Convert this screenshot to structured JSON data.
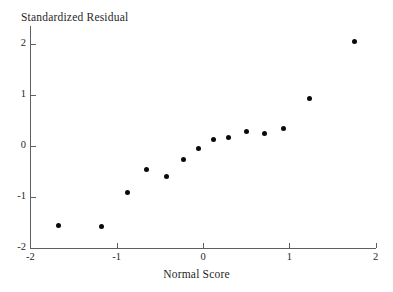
{
  "chart_data": {
    "type": "scatter",
    "title": "Standardized Residual",
    "xlabel": "Normal Score",
    "ylabel": "Standardized Residual",
    "xlim": [
      -2,
      2
    ],
    "ylim": [
      -2,
      2
    ],
    "xticks": [
      -2,
      -1,
      0,
      1,
      2
    ],
    "yticks": [
      -2,
      -1,
      0,
      1,
      2
    ],
    "xtick_labels": [
      "-2",
      "-1",
      "0",
      "1",
      "2"
    ],
    "ytick_labels": [
      "-2",
      "-1",
      "0",
      "1",
      "2"
    ],
    "grid": false,
    "legend": null,
    "marker": "filled-circle",
    "marker_color": "#0a0a0a",
    "axis_color": "#5f5f5f",
    "background": "#ffffff",
    "n_points": 14,
    "x": [
      -1.68,
      -1.18,
      -0.87,
      -0.66,
      -0.42,
      -0.23,
      -0.05,
      0.12,
      0.3,
      0.5,
      0.71,
      0.93,
      1.23,
      1.75
    ],
    "y": [
      -1.55,
      -1.57,
      -0.92,
      -0.47,
      -0.59,
      -0.27,
      -0.04,
      0.12,
      0.16,
      0.29,
      0.25,
      0.35,
      0.94,
      2.04
    ],
    "points": [
      {
        "x": -1.68,
        "y": -1.55
      },
      {
        "x": -1.18,
        "y": -1.57
      },
      {
        "x": -0.87,
        "y": -0.92
      },
      {
        "x": -0.66,
        "y": -0.47
      },
      {
        "x": -0.42,
        "y": -0.59
      },
      {
        "x": -0.23,
        "y": -0.27
      },
      {
        "x": -0.05,
        "y": -0.04
      },
      {
        "x": 0.12,
        "y": 0.12
      },
      {
        "x": 0.3,
        "y": 0.16
      },
      {
        "x": 0.5,
        "y": 0.29
      },
      {
        "x": 0.71,
        "y": 0.25
      },
      {
        "x": 0.93,
        "y": 0.35
      },
      {
        "x": 1.23,
        "y": 0.94
      },
      {
        "x": 1.75,
        "y": 2.04
      }
    ]
  }
}
